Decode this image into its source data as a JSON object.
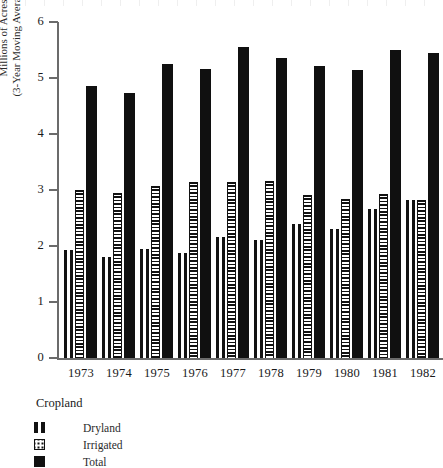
{
  "chart_data": {
    "type": "bar",
    "title": "",
    "subtitle": "",
    "xlabel": "",
    "ylabel": "Millions of Acres (3-Year Moving Averages)",
    "ylabel_line1": "Millions of Acres",
    "ylabel_line2": "(3-Year Moving Averages)",
    "categories": [
      "1973",
      "1974",
      "1975",
      "1976",
      "1977",
      "1978",
      "1979",
      "1980",
      "1981",
      "1982"
    ],
    "series": [
      {
        "name": "Dryland",
        "pattern": "vertical-stripe",
        "values": [
          1.93,
          1.8,
          1.95,
          1.88,
          2.16,
          2.11,
          2.39,
          2.3,
          2.66,
          2.82
        ]
      },
      {
        "name": "Irrigated",
        "pattern": "dotted",
        "values": [
          3.0,
          2.95,
          3.07,
          3.14,
          3.14,
          3.16,
          2.91,
          2.84,
          2.93,
          2.82
        ]
      },
      {
        "name": "Total",
        "pattern": "solid-black",
        "values": [
          4.86,
          4.73,
          5.25,
          5.16,
          5.55,
          5.36,
          5.21,
          5.14,
          5.5,
          5.45
        ]
      }
    ],
    "ylim": [
      0,
      6
    ],
    "yticks": [
      0,
      1,
      2,
      3,
      4,
      5,
      6
    ],
    "ytick_labels": [
      "0",
      "1",
      "2",
      "3",
      "4",
      "5",
      "6"
    ],
    "grid": false,
    "legend_position": "below-left",
    "legend_title": "Cropland",
    "axis_color": "#6b6b6b",
    "bar_color": "#101010"
  },
  "legend": {
    "title": "Cropland",
    "items": [
      {
        "label": "Dryland",
        "icon": "vertical-stripe-swatch"
      },
      {
        "label": "Irrigated",
        "icon": "dotted-swatch"
      },
      {
        "label": "Total",
        "icon": "solid-black-swatch"
      }
    ]
  }
}
